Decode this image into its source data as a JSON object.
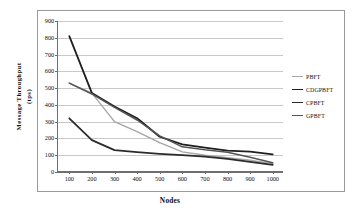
{
  "chart_data": {
    "type": "line",
    "title": "",
    "xlabel": "Nodes",
    "ylabel": "Message Throughput (tps)",
    "ylabel_line1": "Message Throughput",
    "ylabel_line2": "(tps)",
    "x": [
      100,
      200,
      300,
      400,
      500,
      600,
      700,
      800,
      900,
      1000
    ],
    "xticks": [
      "100",
      "200",
      "300",
      "400",
      "500",
      "600",
      "700",
      "800",
      "900",
      "1000"
    ],
    "yticks": [
      "0",
      "100",
      "200",
      "300",
      "400",
      "500",
      "600",
      "700",
      "800",
      "900"
    ],
    "ylim": [
      0,
      900
    ],
    "xlim": [
      50,
      1050
    ],
    "grid": "horizontal",
    "legend_position": "right",
    "series": [
      {
        "name": "PBFT",
        "color": "#a6a6a6",
        "width": 1.4,
        "values": [
          530,
          470,
          300,
          240,
          175,
          120,
          100,
          85,
          70,
          50
        ]
      },
      {
        "name": "CDGPBFT",
        "color": "#1f1f1f",
        "width": 1.8,
        "values": [
          810,
          470,
          390,
          320,
          210,
          165,
          145,
          127,
          122,
          105
        ]
      },
      {
        "name": "CPBFT",
        "color": "#2b2b2b",
        "width": 1.8,
        "values": [
          320,
          190,
          130,
          118,
          108,
          100,
          92,
          78,
          60,
          42
        ]
      },
      {
        "name": "GPBFT",
        "color": "#555555",
        "width": 1.5,
        "values": [
          530,
          465,
          385,
          310,
          215,
          150,
          132,
          118,
          88,
          55
        ]
      }
    ]
  }
}
